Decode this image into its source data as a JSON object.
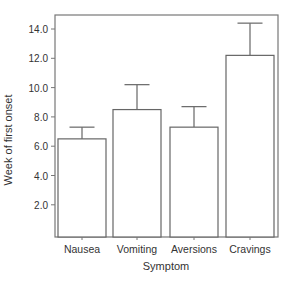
{
  "chart_data": {
    "type": "bar",
    "title": "",
    "xlabel": "Symptom",
    "ylabel": "Week of first onset",
    "categories": [
      "Nausea",
      "Vomiting",
      "Aversions",
      "Cravings"
    ],
    "values": [
      6.5,
      8.5,
      7.3,
      12.2
    ],
    "error_upper": [
      7.3,
      10.2,
      8.7,
      14.4
    ],
    "yticks": [
      "2.0",
      "4.0",
      "6.0",
      "8.0",
      "10.0",
      "12.0",
      "14.0"
    ],
    "ytick_values": [
      2,
      4,
      6,
      8,
      10,
      12,
      14
    ],
    "ylim": [
      0,
      14.8
    ],
    "grid": false,
    "legend": null,
    "colors": {
      "bar_fill": "#ffffff",
      "bar_stroke": "#666666",
      "axis": "#777777"
    }
  }
}
